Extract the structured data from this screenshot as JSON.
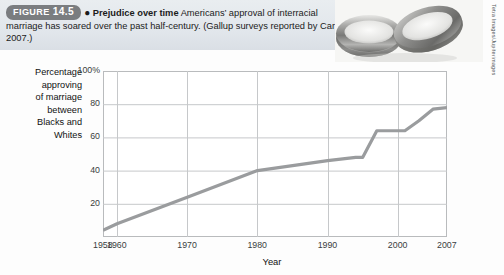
{
  "figure": {
    "badge_label": "FIGURE",
    "badge_number": "14.5",
    "bullet": "●",
    "title": "Prejudice over time",
    "body": " Americans’ approval of interracial marriage has soared over the past half-century. (Gallup surveys reported by Carroll, 2007.)"
  },
  "photo": {
    "alt_name": "wedding-rings-photo",
    "credit": "Tetra Images/Jupiterimages"
  },
  "chart_data": {
    "type": "line",
    "title": "Prejudice over time",
    "xlabel": "Year",
    "ylabel": "Percentage approving of marriage between Blacks and Whites",
    "ylabel_lines": [
      "Percentage",
      "approving",
      "of marriage",
      "between",
      "Blacks and",
      "Whites"
    ],
    "xlim": [
      1958,
      2007
    ],
    "ylim": [
      0,
      100
    ],
    "grid": true,
    "legend": "none",
    "y_ticks": [
      "100%",
      "80",
      "60",
      "40",
      "20"
    ],
    "y_tick_values": [
      100,
      80,
      60,
      40,
      20
    ],
    "x_ticks": [
      "1958",
      "1960",
      "1970",
      "1980",
      "1990",
      "2000",
      "2007"
    ],
    "x_tick_values": [
      1958,
      1960,
      1970,
      1980,
      1990,
      2000,
      2007
    ],
    "series": [
      {
        "name": "Approval of interracial marriage",
        "color": "#9a9c9e",
        "x": [
          1958,
          1960,
          1970,
          1980,
          1990,
          1994,
          1995,
          1997,
          2001,
          2003,
          2005,
          2007
        ],
        "y": [
          4,
          8,
          24,
          40,
          46,
          48,
          48,
          64,
          64,
          70,
          77,
          78
        ]
      }
    ]
  }
}
